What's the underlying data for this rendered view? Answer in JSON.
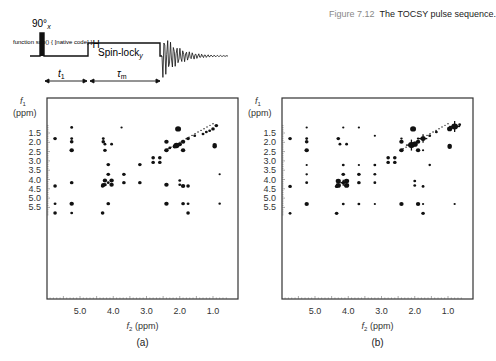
{
  "caption": {
    "number": "Figure 7.12",
    "text": "The TOCSY pulse sequence."
  },
  "pulse_sequence": {
    "nucleus": "1H",
    "pulse_label": "90°",
    "pulse_phase": "x",
    "spinlock_label": "Spin-lock",
    "spinlock_phase": "y",
    "t1_label": "t1",
    "tau_label": "τm"
  },
  "chart_data": [
    {
      "type": "scatter",
      "panel_label": "(a)",
      "title": "TOCSY spectrum (a)",
      "xlabel": "f2 (ppm)",
      "ylabel": "f1 (ppm)",
      "xlim": [
        5.95,
        0.45
      ],
      "ylim": [
        1.0,
        6.0
      ],
      "x_ticks": [
        "5.0",
        "4.0",
        "3.0",
        "2.0",
        "1.0"
      ],
      "y_ticks": [
        "1.5",
        "2.0",
        "2.5",
        "3.0",
        "3.5",
        "4.0",
        "4.5",
        "5.0",
        "5.5"
      ],
      "grid": false,
      "points": [
        {
          "x": 5.25,
          "y": 1.2,
          "s": 1
        },
        {
          "x": 3.75,
          "y": 1.2,
          "s": 0.6
        },
        {
          "x": 2.05,
          "y": 1.28,
          "s": 3
        },
        {
          "x": 0.9,
          "y": 1.1,
          "s": 1.5
        },
        {
          "x": 1.0,
          "y": 1.28,
          "s": 1.5
        },
        {
          "x": 1.1,
          "y": 1.38,
          "s": 1
        },
        {
          "x": 1.2,
          "y": 1.45,
          "s": 1
        },
        {
          "x": 1.3,
          "y": 1.55,
          "s": 1
        },
        {
          "x": 5.75,
          "y": 1.8,
          "s": 1.5
        },
        {
          "x": 5.25,
          "y": 1.8,
          "s": 1
        },
        {
          "x": 4.3,
          "y": 1.8,
          "s": 1
        },
        {
          "x": 1.75,
          "y": 1.8,
          "s": 1.5
        },
        {
          "x": 1.55,
          "y": 1.65,
          "s": 1
        },
        {
          "x": 5.25,
          "y": 1.97,
          "s": 1.5
        },
        {
          "x": 4.3,
          "y": 1.97,
          "s": 1.5
        },
        {
          "x": 2.4,
          "y": 1.97,
          "s": 2
        },
        {
          "x": 1.9,
          "y": 1.97,
          "s": 2
        },
        {
          "x": 4.25,
          "y": 2.1,
          "s": 1
        },
        {
          "x": 4.05,
          "y": 2.1,
          "s": 1
        },
        {
          "x": 2.0,
          "y": 2.1,
          "s": 2
        },
        {
          "x": 2.1,
          "y": 2.17,
          "s": 3
        },
        {
          "x": 2.15,
          "y": 2.22,
          "s": 2
        },
        {
          "x": 0.95,
          "y": 2.15,
          "s": 2
        },
        {
          "x": 0.95,
          "y": 2.22,
          "s": 2
        },
        {
          "x": 2.3,
          "y": 2.3,
          "s": 1
        },
        {
          "x": 5.25,
          "y": 2.43,
          "s": 2
        },
        {
          "x": 4.25,
          "y": 2.43,
          "s": 1.5
        },
        {
          "x": 2.4,
          "y": 2.43,
          "s": 2
        },
        {
          "x": 1.9,
          "y": 2.43,
          "s": 2
        },
        {
          "x": 2.8,
          "y": 2.83,
          "s": 1.5
        },
        {
          "x": 2.6,
          "y": 2.83,
          "s": 1.5
        },
        {
          "x": 2.8,
          "y": 3.08,
          "s": 1.5
        },
        {
          "x": 2.6,
          "y": 3.08,
          "s": 1.5
        },
        {
          "x": 3.2,
          "y": 3.2,
          "s": 1.5
        },
        {
          "x": 4.15,
          "y": 3.2,
          "s": 1.5
        },
        {
          "x": 4.15,
          "y": 3.72,
          "s": 1.5
        },
        {
          "x": 3.68,
          "y": 3.72,
          "s": 1.5
        },
        {
          "x": 0.8,
          "y": 3.72,
          "s": 0.6
        },
        {
          "x": 4.25,
          "y": 4.05,
          "s": 2
        },
        {
          "x": 4.05,
          "y": 4.05,
          "s": 2
        },
        {
          "x": 2.0,
          "y": 4.05,
          "s": 1
        },
        {
          "x": 5.25,
          "y": 4.17,
          "s": 1.5
        },
        {
          "x": 4.15,
          "y": 4.17,
          "s": 1
        },
        {
          "x": 3.68,
          "y": 4.17,
          "s": 1.5
        },
        {
          "x": 3.2,
          "y": 4.17,
          "s": 1.5
        },
        {
          "x": 4.3,
          "y": 4.3,
          "s": 2
        },
        {
          "x": 4.25,
          "y": 4.28,
          "s": 1.5
        },
        {
          "x": 4.05,
          "y": 4.28,
          "s": 2
        },
        {
          "x": 2.4,
          "y": 4.28,
          "s": 2
        },
        {
          "x": 2.0,
          "y": 4.28,
          "s": 1
        },
        {
          "x": 5.75,
          "y": 4.35,
          "s": 1.5
        },
        {
          "x": 4.32,
          "y": 4.35,
          "s": 1.5
        },
        {
          "x": 1.9,
          "y": 4.35,
          "s": 2
        },
        {
          "x": 1.75,
          "y": 4.35,
          "s": 1.5
        },
        {
          "x": 5.75,
          "y": 5.3,
          "s": 1
        },
        {
          "x": 5.25,
          "y": 5.3,
          "s": 2
        },
        {
          "x": 4.15,
          "y": 5.3,
          "s": 1.5
        },
        {
          "x": 2.4,
          "y": 5.3,
          "s": 2
        },
        {
          "x": 1.9,
          "y": 5.3,
          "s": 1.5
        },
        {
          "x": 1.75,
          "y": 5.3,
          "s": 1
        },
        {
          "x": 0.8,
          "y": 5.3,
          "s": 0.8
        },
        {
          "x": 5.75,
          "y": 5.8,
          "s": 1.5
        },
        {
          "x": 5.25,
          "y": 5.8,
          "s": 1
        },
        {
          "x": 4.32,
          "y": 5.8,
          "s": 1.5
        },
        {
          "x": 1.75,
          "y": 5.8,
          "s": 1.5
        }
      ]
    },
    {
      "type": "scatter",
      "panel_label": "(b)",
      "title": "TOCSY spectrum (b)",
      "xlabel": "f2 (ppm)",
      "ylabel": "f1 (ppm)",
      "xlim": [
        5.95,
        0.45
      ],
      "ylim": [
        1.0,
        6.0
      ],
      "x_ticks": [
        "5.0",
        "4.0",
        "3.0",
        "2.0",
        "1.0"
      ],
      "y_ticks": [
        "1.5",
        "2.0",
        "2.5",
        "3.0",
        "3.5",
        "4.0",
        "4.5",
        "5.0",
        "5.5"
      ],
      "grid": false,
      "points": [
        {
          "x": 5.25,
          "y": 1.2,
          "s": 0.6
        },
        {
          "x": 4.15,
          "y": 1.2,
          "s": 0.6
        },
        {
          "x": 3.68,
          "y": 1.2,
          "s": 0.6
        },
        {
          "x": 2.05,
          "y": 1.28,
          "s": 3
        },
        {
          "x": 0.8,
          "y": 1.15,
          "s": 3.5,
          "cross": true
        },
        {
          "x": 0.95,
          "y": 1.28,
          "s": 2.5
        },
        {
          "x": 0.65,
          "y": 1.05,
          "s": 1
        },
        {
          "x": 1.35,
          "y": 1.45,
          "s": 1
        },
        {
          "x": 5.75,
          "y": 1.8,
          "s": 1.5
        },
        {
          "x": 5.25,
          "y": 1.8,
          "s": 1
        },
        {
          "x": 4.3,
          "y": 1.8,
          "s": 1.5
        },
        {
          "x": 2.4,
          "y": 1.8,
          "s": 0.8
        },
        {
          "x": 1.9,
          "y": 1.8,
          "s": 0.8
        },
        {
          "x": 1.75,
          "y": 1.8,
          "s": 2.5,
          "cross": true
        },
        {
          "x": 1.55,
          "y": 1.65,
          "s": 1
        },
        {
          "x": 3.2,
          "y": 1.65,
          "s": 0.6
        },
        {
          "x": 5.25,
          "y": 1.97,
          "s": 1.5
        },
        {
          "x": 2.4,
          "y": 1.97,
          "s": 2
        },
        {
          "x": 1.9,
          "y": 1.97,
          "s": 2
        },
        {
          "x": 4.25,
          "y": 2.1,
          "s": 1
        },
        {
          "x": 4.05,
          "y": 2.1,
          "s": 1
        },
        {
          "x": 2.1,
          "y": 2.15,
          "s": 3.5,
          "cross": true
        },
        {
          "x": 2.0,
          "y": 2.1,
          "s": 3
        },
        {
          "x": 0.95,
          "y": 2.18,
          "s": 2
        },
        {
          "x": 0.95,
          "y": 2.25,
          "s": 2
        },
        {
          "x": 5.25,
          "y": 2.43,
          "s": 2
        },
        {
          "x": 2.4,
          "y": 2.43,
          "s": 2
        },
        {
          "x": 1.9,
          "y": 2.43,
          "s": 2
        },
        {
          "x": 1.75,
          "y": 2.43,
          "s": 0.6
        },
        {
          "x": 2.8,
          "y": 2.83,
          "s": 1.5
        },
        {
          "x": 2.6,
          "y": 2.83,
          "s": 1.5
        },
        {
          "x": 2.8,
          "y": 3.08,
          "s": 1.5
        },
        {
          "x": 2.6,
          "y": 3.08,
          "s": 1.5
        },
        {
          "x": 5.25,
          "y": 3.22,
          "s": 0.6
        },
        {
          "x": 4.15,
          "y": 3.22,
          "s": 1
        },
        {
          "x": 3.68,
          "y": 3.22,
          "s": 0.6
        },
        {
          "x": 3.2,
          "y": 3.22,
          "s": 1
        },
        {
          "x": 1.55,
          "y": 3.22,
          "s": 0.8
        },
        {
          "x": 5.25,
          "y": 3.72,
          "s": 0.8
        },
        {
          "x": 4.15,
          "y": 3.72,
          "s": 1.5
        },
        {
          "x": 3.68,
          "y": 3.72,
          "s": 1.5
        },
        {
          "x": 3.2,
          "y": 3.72,
          "s": 1
        },
        {
          "x": 4.3,
          "y": 4.08,
          "s": 2.5
        },
        {
          "x": 4.05,
          "y": 4.08,
          "s": 2.5
        },
        {
          "x": 2.0,
          "y": 4.08,
          "s": 1
        },
        {
          "x": 4.15,
          "y": 4.17,
          "s": 1.5,
          "cross": true
        },
        {
          "x": 5.25,
          "y": 4.17,
          "s": 1
        },
        {
          "x": 3.68,
          "y": 4.17,
          "s": 1.5
        },
        {
          "x": 3.2,
          "y": 4.17,
          "s": 1
        },
        {
          "x": 4.3,
          "y": 4.32,
          "s": 2.5
        },
        {
          "x": 4.05,
          "y": 4.32,
          "s": 2.5
        },
        {
          "x": 2.0,
          "y": 4.32,
          "s": 1
        },
        {
          "x": 5.75,
          "y": 4.37,
          "s": 1.5
        },
        {
          "x": 4.35,
          "y": 4.37,
          "s": 1.5
        },
        {
          "x": 1.75,
          "y": 4.37,
          "s": 1
        },
        {
          "x": 5.25,
          "y": 5.32,
          "s": 2
        },
        {
          "x": 4.15,
          "y": 5.32,
          "s": 1
        },
        {
          "x": 3.68,
          "y": 5.32,
          "s": 1
        },
        {
          "x": 3.2,
          "y": 5.32,
          "s": 0.6
        },
        {
          "x": 2.4,
          "y": 5.32,
          "s": 2
        },
        {
          "x": 1.9,
          "y": 5.32,
          "s": 2
        },
        {
          "x": 1.75,
          "y": 5.32,
          "s": 0.6
        },
        {
          "x": 0.8,
          "y": 5.32,
          "s": 0.6
        },
        {
          "x": 5.75,
          "y": 5.82,
          "s": 1
        },
        {
          "x": 4.35,
          "y": 5.82,
          "s": 1.5
        },
        {
          "x": 1.75,
          "y": 5.82,
          "s": 1.5
        }
      ]
    }
  ]
}
